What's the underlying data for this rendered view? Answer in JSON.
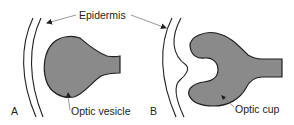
{
  "figure": {
    "type": "anatomical-diagram",
    "fill_color": "#8a8a8a",
    "stroke_color": "#231f20"
  },
  "labels": {
    "epidermis": "Epidermis",
    "optic_vesicle": "Optic vesicle",
    "optic_cup": "Optic cup"
  },
  "panels": [
    {
      "id": "A",
      "label": "A",
      "structure": "Optic vesicle"
    },
    {
      "id": "B",
      "label": "B",
      "structure": "Optic cup"
    }
  ]
}
